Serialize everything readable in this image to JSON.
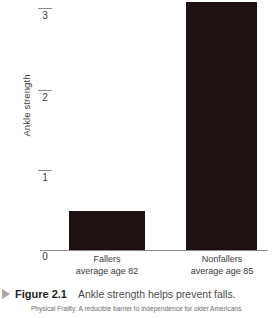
{
  "chart_data": {
    "type": "bar",
    "title": "Ankle strength helps prevent falls.",
    "xlabel": "",
    "ylabel": "Ankle strength",
    "categories": [
      "Fallers",
      "Nonfallers"
    ],
    "category_sublabels": [
      "average age 82",
      "average age 85"
    ],
    "values": [
      0.49,
      3.1
    ],
    "yticks": [
      0,
      1,
      2,
      3
    ],
    "ytick_labels": [
      "0",
      "1",
      "2",
      "3"
    ],
    "ylim": [
      0,
      3.15
    ],
    "grid": false,
    "legend": false,
    "bar_color": "#1f1111",
    "axis_color": "#8b8b8b"
  },
  "axis": {
    "y_title": "Ankle strength",
    "ticks": [
      {
        "label": "3",
        "value": 3
      },
      {
        "label": "2",
        "value": 2
      },
      {
        "label": "1",
        "value": 1
      },
      {
        "label": "0",
        "value": 0
      }
    ]
  },
  "bars": [
    {
      "name": "Fallers",
      "sublabel": "average age 82",
      "value": 0.49
    },
    {
      "name": "Nonfallers",
      "sublabel": "average age 85",
      "value": 3.1
    }
  ],
  "caption": {
    "marker": "triangle-right-icon",
    "label": "Figure 2.1",
    "text": "Ankle strength helps prevent falls."
  },
  "source": {
    "text": "Physical Frailty: A reducible barrier to independence for older Americans."
  }
}
